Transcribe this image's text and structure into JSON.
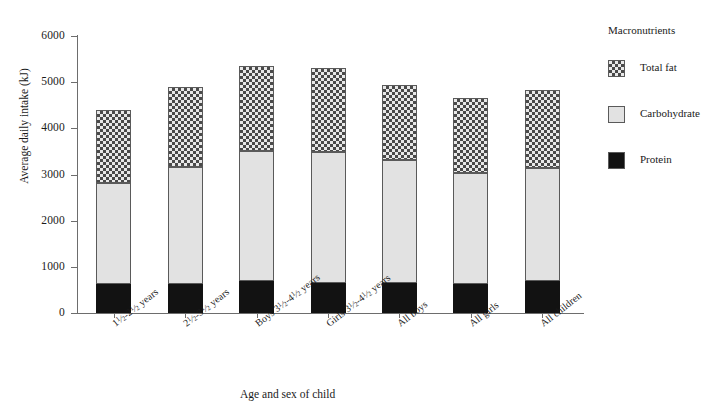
{
  "chart_data": {
    "type": "bar",
    "subtype": "stacked-bar",
    "title": "",
    "xlabel": "Age and sex of child",
    "ylabel": "Average daily intake (kJ)",
    "ylim": [
      0,
      6000
    ],
    "ytick_labels": [
      "6000",
      "5000",
      "4000",
      "3000",
      "2000",
      "1000",
      "0"
    ],
    "ytick_values": [
      6000,
      5000,
      4000,
      3000,
      2000,
      1000,
      0
    ],
    "grid": false,
    "legend_position": "right",
    "legend_title": "Macronutrients",
    "categories": [
      "1½-2½ years",
      "2½-3½ years",
      "Boys 3½-4½ years",
      "Girls 3½-4½ years",
      "All boys",
      "All girls",
      "All children"
    ],
    "series": [
      {
        "name": "Protein",
        "values": [
          630,
          630,
          690,
          650,
          650,
          630,
          690
        ]
      },
      {
        "name": "Carbohydrate",
        "values": [
          2185,
          2530,
          2810,
          2840,
          2660,
          2410,
          2460
        ]
      },
      {
        "name": "Total fat",
        "values": [
          1585,
          1730,
          1840,
          1810,
          1630,
          1610,
          1680
        ]
      }
    ],
    "totals": [
      4400,
      4890,
      5340,
      5300,
      4940,
      4650,
      4830
    ],
    "cumulative_tops": {
      "protein": [
        630,
        630,
        690,
        650,
        650,
        630,
        690
      ],
      "carbohydrate": [
        2815,
        3160,
        3500,
        3490,
        3310,
        3040,
        3150
      ],
      "total_fat": [
        4400,
        4890,
        5340,
        5300,
        4940,
        4650,
        4830
      ]
    },
    "colors": {
      "protein": "#121212",
      "carbohydrate": "#e2e2e2",
      "total_fat": "#4a4a4a",
      "axis": "#6d6d6d",
      "background": "#ffffff"
    }
  },
  "axes": {
    "y_title": "Average daily intake (kJ)",
    "x_title": "Age and sex of child",
    "y_ticks": [
      {
        "label": "6000",
        "value": 6000
      },
      {
        "label": "5000",
        "value": 5000
      },
      {
        "label": "4000",
        "value": 4000
      },
      {
        "label": "3000",
        "value": 3000
      },
      {
        "label": "2000",
        "value": 2000
      },
      {
        "label": "1000",
        "value": 1000
      },
      {
        "label": "0",
        "value": 0
      }
    ]
  },
  "x_labels": [
    {
      "prefix": "",
      "a_whole": "1",
      "a_frac": "1/2",
      "dash": "-",
      "b_whole": "2",
      "b_frac": "1/2",
      "suffix": "years"
    },
    {
      "prefix": "",
      "a_whole": "2",
      "a_frac": "1/2",
      "dash": "-",
      "b_whole": "3",
      "b_frac": "1/2",
      "suffix": "years"
    },
    {
      "prefix": "Boys ",
      "a_whole": "3",
      "a_frac": "1/2",
      "dash": "-",
      "b_whole": "4",
      "b_frac": "1/2",
      "suffix": "years"
    },
    {
      "prefix": "Girls ",
      "a_whole": "3",
      "a_frac": "1/2",
      "dash": "-",
      "b_whole": "4",
      "b_frac": "1/2",
      "suffix": "years"
    },
    {
      "prefix": "All boys",
      "a_whole": "",
      "a_frac": "",
      "dash": "",
      "b_whole": "",
      "b_frac": "",
      "suffix": ""
    },
    {
      "prefix": "All girls",
      "a_whole": "",
      "a_frac": "",
      "dash": "",
      "b_whole": "",
      "b_frac": "",
      "suffix": ""
    },
    {
      "prefix": "All children",
      "a_whole": "",
      "a_frac": "",
      "dash": "",
      "b_whole": "",
      "b_frac": "",
      "suffix": ""
    }
  ],
  "legend": {
    "title": "Macronutrients",
    "items": [
      {
        "label": "Total fat",
        "key": "total_fat",
        "swatch": "checkered-swatch"
      },
      {
        "label": "Carbohydrate",
        "key": "carbohydrate",
        "swatch": "light-gray-swatch"
      },
      {
        "label": "Protein",
        "key": "protein",
        "swatch": "black-swatch"
      }
    ]
  }
}
